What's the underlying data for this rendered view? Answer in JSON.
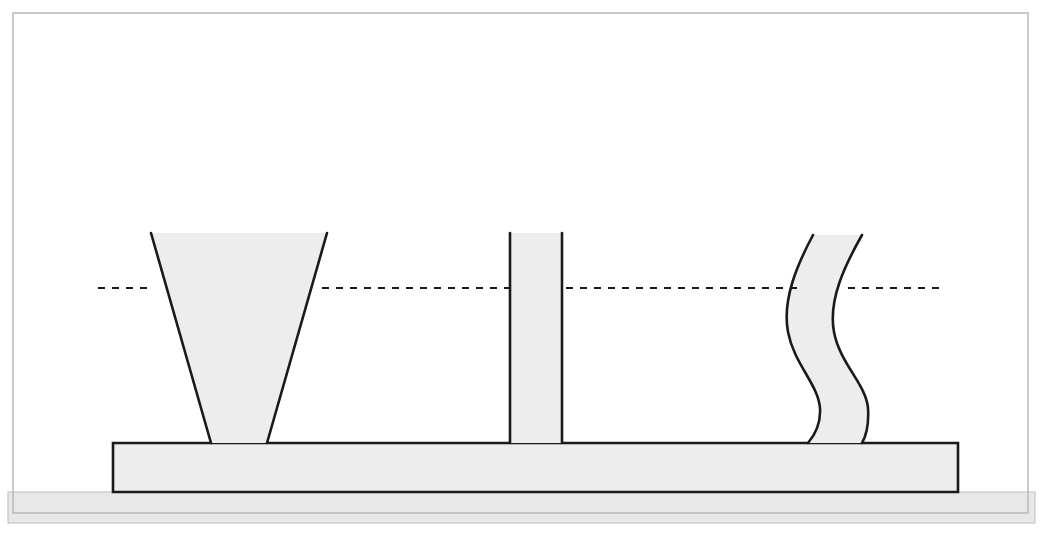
{
  "figure": {
    "name": "rib-cross-section-diagram",
    "canvas": {
      "width": 1043,
      "height": 539
    },
    "colors": {
      "background": "#ffffff",
      "outline_border": "#b9b9b9",
      "stroke_dark": "#1a1a1a",
      "fill_light_gray": "#ededed",
      "ground_strip": "#e8e8e8",
      "ground_strip_edge": "#bdbdbd",
      "dashed_line": "#1a1a1a"
    },
    "frame": {
      "label": "outer-image-border",
      "x": 13,
      "y": 13,
      "width": 1015,
      "height": 500,
      "stroke_width": 1.5
    },
    "ground_strip": {
      "label": "ground-hatch-strip",
      "x": 8,
      "y": 492,
      "width": 1027,
      "height": 31
    },
    "base_plate": {
      "label": "base-plate",
      "x": 113,
      "y": 443,
      "width": 845,
      "height": 49,
      "note": "Horizontal flange / base plate running the full width beneath all three ribs"
    },
    "dashed_reference_line": {
      "label": "fill-level-reference-line",
      "y": 288,
      "dash_pattern": "7 7",
      "stroke_width": 2.2,
      "segments": [
        {
          "name": "segment-far-left",
          "x1": 98,
          "x2": 152
        },
        {
          "name": "segment-between-funnel-and-rib",
          "x1": 322,
          "x2": 509
        },
        {
          "name": "segment-between-rib-and-wave",
          "x1": 566,
          "x2": 800
        },
        {
          "name": "segment-far-right",
          "x1": 848,
          "x2": 944
        }
      ]
    },
    "ribs": [
      {
        "id": "rib-1",
        "name": "tapered-v-rib",
        "shape": "tapered",
        "description": "V-shaped / trapezoidal rib, wide at the top and narrowing toward the base plate",
        "top_left_x": 151,
        "top_right_x": 327,
        "top_y": 233,
        "base_left_x": 211,
        "base_right_x": 267,
        "base_y": 443,
        "top_width": 176,
        "base_width": 56
      },
      {
        "id": "rib-2",
        "name": "straight-vertical-rib",
        "shape": "straight",
        "description": "Parallel-sided vertical rib of constant thickness",
        "top_left_x": 510,
        "top_right_x": 562,
        "top_y": 233,
        "base_left_x": 510,
        "base_right_x": 562,
        "base_y": 443,
        "top_width": 52,
        "base_width": 52
      },
      {
        "id": "rib-3",
        "name": "wavy-s-curve-rib",
        "shape": "wavy",
        "description": "S-curved / serpentine rib of roughly constant thickness, deflected laterally",
        "top_left_x": 813,
        "top_right_x": 862,
        "top_y": 235,
        "base_left_x": 808,
        "base_right_x": 862,
        "base_y": 443,
        "top_width": 49,
        "base_width": 54,
        "left_curve_path": "M 813 235 C 797 265, 782 300, 788 332 C 794 364, 818 384, 820 408 C 821 424, 814 436, 808 443",
        "right_curve_path": "M 862 235 C 845 265, 828 300, 834 332 C 840 364, 866 384, 868 408 C 869 424, 866 436, 862 443"
      }
    ]
  }
}
